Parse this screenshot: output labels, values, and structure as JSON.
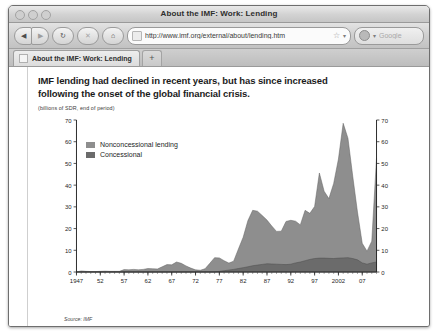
{
  "window": {
    "title": "About the IMF: Work: Lending",
    "traffic_lights": [
      "close-button",
      "minimize-button",
      "zoom-button"
    ]
  },
  "toolbar": {
    "back_label": "◀",
    "forward_label": "▶",
    "reload_label": "↻",
    "stop_label": "✕",
    "home_label": "⌂",
    "url": "http://www.imf.org/external/about/lending.htm",
    "url_placeholder": "Enter address",
    "bookmark_label": "☆",
    "dropdown_label": "▾",
    "search_placeholder": "Google",
    "search_value": ""
  },
  "tabs": [
    {
      "label": "About the IMF: Work: Lending",
      "active": true
    }
  ],
  "new_tab_label": "+",
  "chart_data": {
    "type": "area",
    "stacked": true,
    "title": "IMF lending had declined in recent years, but has since increased following the onset of the global financial crisis.",
    "subtitle": "(billions of SDR, end of period)",
    "source": "Source: IMF",
    "xlabel": "",
    "ylabel": "",
    "ylim": [
      0,
      70
    ],
    "yticks": [
      0,
      10,
      20,
      30,
      40,
      50,
      60,
      70
    ],
    "ytick_labels": [
      "0",
      "10",
      "20",
      "30",
      "40",
      "50",
      "60",
      "70"
    ],
    "right_axis": true,
    "right_ytick_labels": [
      "0",
      "10",
      "20",
      "30",
      "40",
      "50",
      "60",
      "70"
    ],
    "grid": false,
    "legend_position": "upper-left",
    "xtick_labels": [
      "1947",
      "52",
      "57",
      "62",
      "67",
      "72",
      "77",
      "82",
      "87",
      "92",
      "97",
      "2002",
      "07"
    ],
    "xtick_years": [
      1947,
      1952,
      1957,
      1962,
      1967,
      1972,
      1977,
      1982,
      1987,
      1992,
      1997,
      2002,
      2007
    ],
    "xlim": [
      1947,
      2010
    ],
    "colors": {
      "nonconcessional": "#8e8e8e",
      "concessional": "#6b6b6b",
      "axis": "#2a2a2a",
      "plot_background": "#ffffff"
    },
    "x": [
      1947,
      1948,
      1949,
      1950,
      1951,
      1952,
      1953,
      1954,
      1955,
      1956,
      1957,
      1958,
      1959,
      1960,
      1961,
      1962,
      1963,
      1964,
      1965,
      1966,
      1967,
      1968,
      1969,
      1970,
      1971,
      1972,
      1973,
      1974,
      1975,
      1976,
      1977,
      1978,
      1979,
      1980,
      1981,
      1982,
      1983,
      1984,
      1985,
      1986,
      1987,
      1988,
      1989,
      1990,
      1991,
      1992,
      1993,
      1994,
      1995,
      1996,
      1997,
      1998,
      1999,
      2000,
      2001,
      2002,
      2003,
      2004,
      2005,
      2006,
      2007,
      2008,
      2009,
      2010
    ],
    "series": [
      {
        "name": "Nonconcessional lending",
        "color": "#8e8e8e",
        "values": [
          0.0,
          0.5,
          0.3,
          0.2,
          0.2,
          0.3,
          0.4,
          0.3,
          0.3,
          0.3,
          1.1,
          1.0,
          1.2,
          1.0,
          1.2,
          1.6,
          1.5,
          1.4,
          2.4,
          3.4,
          3.3,
          4.6,
          4.0,
          2.8,
          1.8,
          1.0,
          0.8,
          1.5,
          4.0,
          6.6,
          6.2,
          4.6,
          3.2,
          3.8,
          9.0,
          14.0,
          21.3,
          25.5,
          24.8,
          22.5,
          20.1,
          17.5,
          15.1,
          15.3,
          19.9,
          20.2,
          19.2,
          17.1,
          23.2,
          21.2,
          24.0,
          39.2,
          30.8,
          27.5,
          34.6,
          45.6,
          62.0,
          55.0,
          38.0,
          22.0,
          9.0,
          6.0,
          10.0,
          48.0
        ]
      },
      {
        "name": "Concessional",
        "color": "#6b6b6b",
        "values": [
          0.0,
          0.0,
          0.0,
          0.0,
          0.0,
          0.0,
          0.0,
          0.0,
          0.0,
          0.0,
          0.0,
          0.0,
          0.0,
          0.0,
          0.0,
          0.0,
          0.0,
          0.0,
          0.0,
          0.0,
          0.0,
          0.0,
          0.0,
          0.0,
          0.0,
          0.0,
          0.0,
          0.0,
          0.0,
          0.0,
          0.3,
          0.6,
          0.9,
          1.2,
          1.6,
          2.0,
          2.4,
          2.9,
          3.2,
          3.5,
          3.8,
          3.7,
          3.6,
          3.5,
          3.4,
          3.6,
          4.2,
          4.6,
          5.2,
          5.8,
          6.2,
          6.4,
          6.4,
          6.3,
          6.2,
          6.4,
          6.5,
          6.6,
          6.2,
          5.6,
          4.2,
          3.6,
          4.2,
          4.6
        ]
      }
    ]
  }
}
